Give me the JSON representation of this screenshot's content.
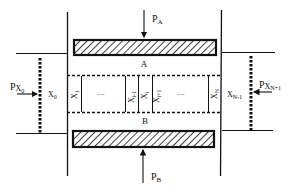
{
  "diagram": {
    "type": "schematic",
    "colors": {
      "stroke": "#111111",
      "background": "#ffffff"
    },
    "plates": [
      {
        "id": "A",
        "label": "A",
        "force": {
          "base": "P",
          "sub": "A"
        }
      },
      {
        "id": "B",
        "label": "B",
        "force": {
          "base": "P",
          "sub": "B"
        }
      }
    ],
    "boundaries": {
      "left": {
        "label": {
          "base": "X",
          "sub": "0"
        },
        "force": {
          "base": "P",
          "sub": "X",
          "subsub": "0"
        }
      },
      "right": {
        "label": {
          "base": "X",
          "sub": "N-1"
        },
        "force": {
          "base": "P",
          "sub": "X",
          "subsub": "N+1"
        }
      }
    },
    "compartments": [
      {
        "base": "X",
        "sub": "1"
      },
      {
        "ellipsis": "···"
      },
      {
        "base": "X",
        "sub": "i-1"
      },
      {
        "base": "X",
        "sub": "i"
      },
      {
        "base": "X",
        "sub": "i+1"
      },
      {
        "ellipsis": "···"
      },
      {
        "base": "X",
        "sub": "N"
      }
    ]
  }
}
